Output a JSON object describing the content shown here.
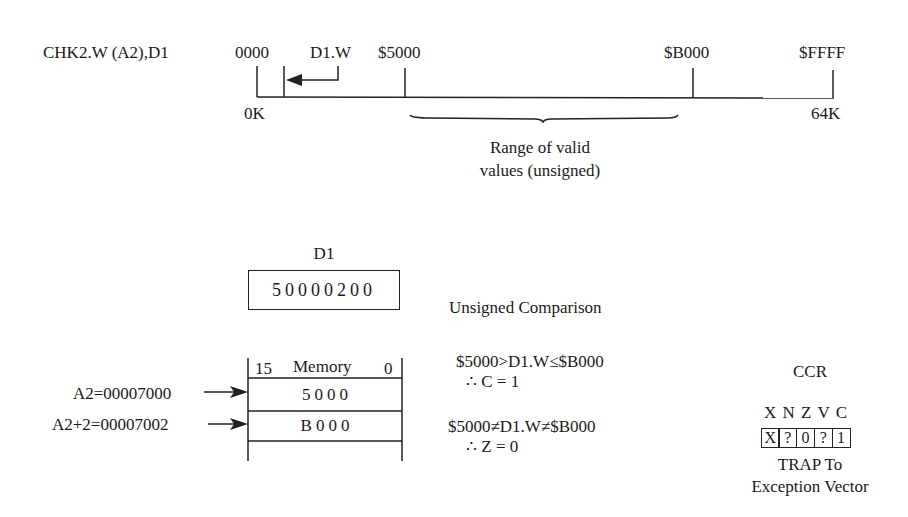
{
  "instruction": "CHK2.W (A2),D1",
  "memory_map": {
    "start_label": "0000",
    "d1w_label": "D1.W",
    "lower_bound_label": "$5000",
    "upper_bound_label": "$B000",
    "end_label": "$FFFF",
    "start_size": "0K",
    "end_size": "64K",
    "range_caption_line1": "Range of valid",
    "range_caption_line2": "values (unsigned)"
  },
  "register": {
    "name": "D1",
    "value": "50000200"
  },
  "comparison": {
    "title": "Unsigned Comparison",
    "carry_test": "$5000>D1.W≤$B000",
    "carry_result": "∴ C = 1",
    "zero_test": "$5000≠D1.W≠$B000",
    "zero_result": "∴ Z = 0"
  },
  "memory": {
    "header_high_bit": "15",
    "header_title": "Memory",
    "header_low_bit": "0",
    "rows": [
      {
        "address_label": "A2=00007000",
        "value": "5000"
      },
      {
        "address_label": "A2+2=00007002",
        "value": "B000"
      }
    ]
  },
  "ccr": {
    "title": "CCR",
    "flag_names": [
      "X",
      "N",
      "Z",
      "V",
      "C"
    ],
    "flag_values": [
      "X",
      "?",
      "0",
      "?",
      "1"
    ],
    "result_line1": "TRAP To",
    "result_line2": "Exception Vector"
  }
}
